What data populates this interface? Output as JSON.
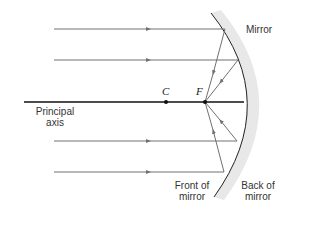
{
  "diagram": {
    "type": "concave-mirror-ray-diagram",
    "labels": {
      "mirror": "Mirror",
      "principal_axis_line1": "Principal",
      "principal_axis_line2": "axis",
      "front_line1": "Front of",
      "front_line2": "mirror",
      "back_line1": "Back of",
      "back_line2": "mirror"
    },
    "points": {
      "center_of_curvature": "C",
      "focal_point": "F"
    },
    "rays": [
      {
        "y": 29,
        "hits_mirror_x": 225
      },
      {
        "y": 60,
        "hits_mirror_x": 238
      },
      {
        "y": 141,
        "hits_mirror_x": 237
      },
      {
        "y": 172,
        "hits_mirror_x": 224
      }
    ],
    "colors": {
      "ray": "#707070",
      "axis": "#111111",
      "mirror_line": "#222222",
      "mirror_shade": "#e6e6e6"
    }
  }
}
